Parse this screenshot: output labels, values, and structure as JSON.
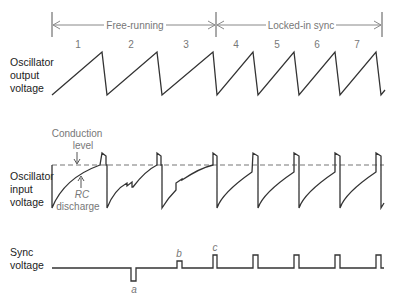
{
  "header": {
    "free_running": "Free-running",
    "locked_in_sync": "Locked-in sync"
  },
  "cycles": [
    "1",
    "2",
    "3",
    "4",
    "5",
    "6",
    "7"
  ],
  "rows": {
    "output": {
      "line1": "Oscillator",
      "line2": "output",
      "line3": "voltage"
    },
    "input": {
      "line1": "Oscillator",
      "line2": "input",
      "line3": "voltage"
    },
    "sync": {
      "line1": "Sync",
      "line2": "voltage"
    }
  },
  "annotations": {
    "conduction_line1": "Conduction",
    "conduction_line2": "level",
    "rc_line1": "RC",
    "rc_line2": "discharge",
    "pulse_a": "a",
    "pulse_b": "b",
    "pulse_c": "c"
  },
  "colors": {
    "waveform": "#333333",
    "annotation": "#808080",
    "dashed": "#777777"
  }
}
